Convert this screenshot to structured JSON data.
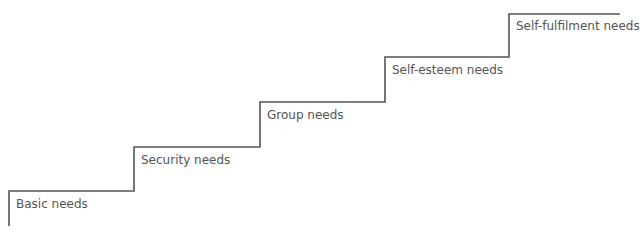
{
  "diagram": {
    "type": "staircase",
    "line_color": "#555555",
    "text_color": "#555555",
    "steps": [
      {
        "label": "Basic needs"
      },
      {
        "label": "Security needs"
      },
      {
        "label": "Group needs"
      },
      {
        "label": "Self-esteem needs"
      },
      {
        "label": "Self-fulfilment needs"
      }
    ]
  }
}
